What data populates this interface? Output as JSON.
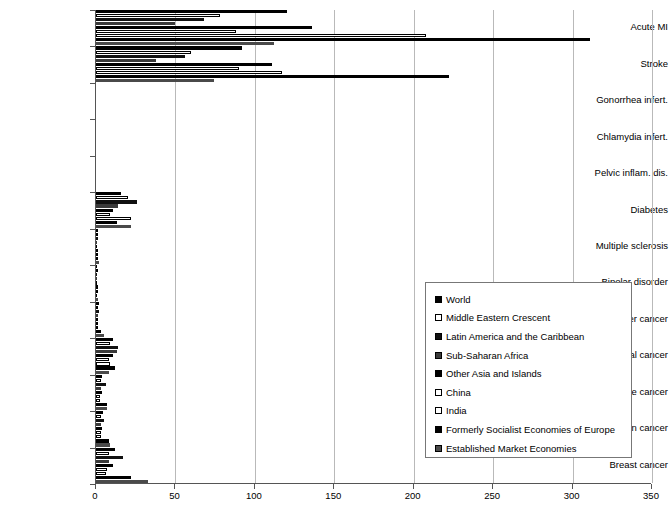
{
  "chart_data": {
    "type": "bar",
    "orientation": "horizontal",
    "title": "",
    "subtitle": "",
    "xlabel": "",
    "ylabel": "",
    "xlim": [
      0,
      350
    ],
    "xticks": [
      0,
      50,
      100,
      150,
      200,
      250,
      300,
      350
    ],
    "grid": true,
    "legend_position": "lower-right",
    "categories": [
      "Acute MI",
      "Stroke",
      "Gonorrhea infert.",
      "Chlamydia infert.",
      "Pelvic inflam. dis.",
      "Diabetes",
      "Multiple sclerosis",
      "Bipolar disorder",
      "Bladder cancer",
      "Cervical cancer",
      "Uterine cancer",
      "Ovarian cancer",
      "Breast cancer"
    ],
    "series": [
      {
        "name": "World",
        "key": "s-world",
        "color": "#000000",
        "values": [
          120,
          92,
          0,
          0,
          0,
          16,
          1,
          0.6,
          2,
          11,
          4,
          4.5,
          12
        ]
      },
      {
        "name": "Middle Eastern Crescent",
        "key": "s-mec",
        "color": "#ffffff",
        "values": [
          78,
          60,
          0,
          0,
          0,
          20,
          0.5,
          0.5,
          1.5,
          9,
          3,
          3,
          8
        ]
      },
      {
        "name": "Latin America and the Caribbean",
        "key": "s-lac",
        "color": "#111111",
        "values": [
          68,
          56,
          0,
          0,
          0,
          26,
          1,
          0.6,
          2,
          14,
          6,
          5,
          17
        ]
      },
      {
        "name": "Sub-Saharan Africa",
        "key": "s-ssa",
        "color": "#3a3a3a",
        "values": [
          50,
          38,
          0,
          0,
          0,
          14,
          0.4,
          0.5,
          1,
          13,
          3,
          3,
          8
        ]
      },
      {
        "name": "Other Asia and Islands",
        "key": "s-oai",
        "color": "#000000",
        "values": [
          136,
          111,
          0,
          0,
          0,
          11,
          0.6,
          0.5,
          1.5,
          11,
          3.5,
          4,
          11
        ]
      },
      {
        "name": "China",
        "key": "s-china",
        "color": "#ffffff",
        "values": [
          88,
          90,
          0,
          0,
          0,
          9,
          0.4,
          0.4,
          1,
          8,
          2.5,
          3,
          7
        ]
      },
      {
        "name": "India",
        "key": "s-india",
        "color": "#ffffff",
        "values": [
          208,
          117,
          0,
          0,
          0,
          22,
          0.5,
          0.5,
          1.5,
          9,
          2.5,
          3,
          6
        ]
      },
      {
        "name": "Formerly Socialist Economies of Europe",
        "key": "s-fse",
        "color": "#000000",
        "values": [
          311,
          222,
          0,
          0,
          0,
          13,
          1.5,
          0.8,
          3,
          12,
          7,
          8,
          22
        ]
      },
      {
        "name": "Established Market Economies",
        "key": "s-eme",
        "color": "#4a4a4a",
        "values": [
          112,
          74,
          0,
          0,
          0,
          22,
          2,
          1,
          5,
          8,
          7,
          9,
          33
        ]
      }
    ]
  },
  "legend": {
    "items": [
      {
        "label": "World",
        "key": "s-world"
      },
      {
        "label": "Middle Eastern Crescent",
        "key": "s-mec"
      },
      {
        "label": "Latin America and the Caribbean",
        "key": "s-lac"
      },
      {
        "label": "Sub-Saharan Africa",
        "key": "s-ssa"
      },
      {
        "label": "Other Asia and Islands",
        "key": "s-oai"
      },
      {
        "label": "China",
        "key": "s-china"
      },
      {
        "label": "India",
        "key": "s-india"
      },
      {
        "label": "Formerly Socialist Economies of Europe",
        "key": "s-fse"
      },
      {
        "label": "Established Market Economies",
        "key": "s-eme"
      }
    ]
  }
}
